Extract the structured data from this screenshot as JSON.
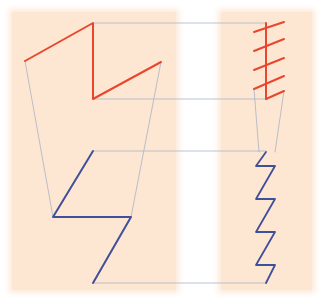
{
  "canvas": {
    "width": 324,
    "height": 305,
    "background": "#ffffff"
  },
  "colors": {
    "panel": "#fde6d2",
    "red": "#e8472e",
    "blue": "#3f4f9a",
    "guide": "#a9b4c6"
  },
  "panels": [
    {
      "name": "left-panel",
      "x": 12,
      "y": 12,
      "w": 164,
      "h": 278
    },
    {
      "name": "right-panel",
      "x": 221,
      "y": 12,
      "w": 91,
      "h": 278
    }
  ],
  "shapes": {
    "red_left": {
      "points": "25,61 93,23 93,99 161,62"
    },
    "blue_left": {
      "points": "93,151 53,217 131,217 93,283"
    },
    "red_right_spine": {
      "points": "266,23 266,99"
    },
    "red_right_ticks": [
      {
        "points": "254,32 284,22"
      },
      {
        "points": "254,51 284,39"
      },
      {
        "points": "254,70 284,58"
      },
      {
        "points": "254,89 284,76"
      },
      {
        "points": "266,99 284,91"
      }
    ],
    "blue_right": {
      "points": "266,152 256,166 275,166 256,199 275,199 256,232 275,232 256,265 275,265 266,283"
    }
  },
  "guides": [
    {
      "points": "93,23 266,23"
    },
    {
      "points": "93,99 266,99"
    },
    {
      "points": "93,151 266,151"
    },
    {
      "points": "93,283 266,283"
    },
    {
      "points": "25,61 53,217"
    },
    {
      "points": "161,62 131,217"
    },
    {
      "points": "254,89 259,152"
    },
    {
      "points": "284,91 275,152"
    }
  ]
}
